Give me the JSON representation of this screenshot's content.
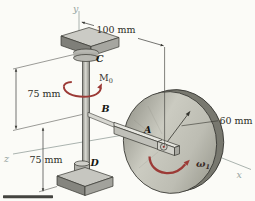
{
  "points": {
    "a": "A",
    "b": "B",
    "c": "C",
    "d": "D"
  },
  "axes": {
    "x": "x",
    "y": "y",
    "z": "z"
  },
  "dims": {
    "offset": "100 mm",
    "upper": "75 mm",
    "lower": "75 mm",
    "radius": "60 mm"
  },
  "sym": {
    "moment": "M",
    "moment_sub": "0",
    "omega": "ω",
    "omega_sub": "1"
  },
  "colors": {
    "accent_red": "#9c3a36",
    "axis_label": "#96a49f",
    "background": "#fbfbf7",
    "metal_light": "#cbcbc1",
    "metal_dark": "#78786f"
  }
}
